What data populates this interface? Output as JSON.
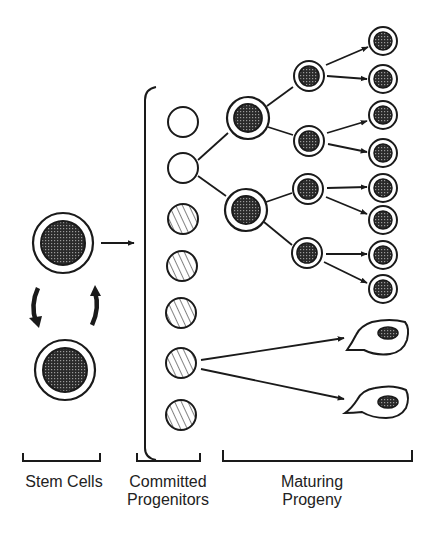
{
  "labels": {
    "stem": "Stem Cells",
    "committed_line1": "Committed",
    "committed_line2": "Progenitors",
    "maturing_line1": "Maturing",
    "maturing_line2": "Progeny"
  },
  "colors": {
    "ink": "#1a1a1a",
    "nucleus": "#3a3a3a",
    "background": "#ffffff"
  },
  "stem_cells": [
    {
      "cx": 63,
      "cy": 243
    },
    {
      "cx": 65,
      "cy": 370
    }
  ],
  "progenitors": [
    {
      "cx": 183,
      "cy": 122,
      "fill": "empty"
    },
    {
      "cx": 183,
      "cy": 168,
      "fill": "empty"
    },
    {
      "cx": 183,
      "cy": 219,
      "fill": "hatched"
    },
    {
      "cx": 182,
      "cy": 266,
      "fill": "hatched"
    },
    {
      "cx": 181,
      "cy": 313,
      "fill": "hatched"
    },
    {
      "cx": 181,
      "cy": 363,
      "fill": "hatched"
    },
    {
      "cx": 181,
      "cy": 415,
      "fill": "hatched"
    }
  ],
  "gen1": [
    {
      "cx": 248,
      "cy": 118
    },
    {
      "cx": 246,
      "cy": 210
    }
  ],
  "gen2": [
    {
      "cx": 309,
      "cy": 76
    },
    {
      "cx": 309,
      "cy": 141
    },
    {
      "cx": 308,
      "cy": 189
    },
    {
      "cx": 307,
      "cy": 253
    }
  ],
  "gen3": [
    {
      "cx": 383,
      "cy": 41
    },
    {
      "cx": 383,
      "cy": 79
    },
    {
      "cx": 383,
      "cy": 115
    },
    {
      "cx": 383,
      "cy": 153
    },
    {
      "cx": 383,
      "cy": 188
    },
    {
      "cx": 383,
      "cy": 220
    },
    {
      "cx": 383,
      "cy": 255
    },
    {
      "cx": 383,
      "cy": 289
    }
  ]
}
